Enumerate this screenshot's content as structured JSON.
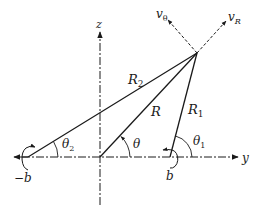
{
  "figure": {
    "title": "",
    "colors": {
      "ink": "#1a1a1a",
      "background": "#ffffff"
    },
    "axes": {
      "z_label": "z",
      "y_label": "y"
    },
    "points": {
      "left_charge_label": "−b",
      "right_charge_label": "b"
    },
    "distances": {
      "R": "R",
      "R1": {
        "base": "R",
        "sub": "1"
      },
      "R2": {
        "base": "R",
        "sub": "2"
      }
    },
    "angles": {
      "theta": "θ",
      "theta1": {
        "base": "θ",
        "sub": "1"
      },
      "theta2": {
        "base": "θ",
        "sub": "2"
      }
    },
    "velocities": {
      "v_theta": {
        "base": "v",
        "sub": "θ"
      },
      "v_R": {
        "base": "v",
        "sub": "R"
      }
    }
  }
}
